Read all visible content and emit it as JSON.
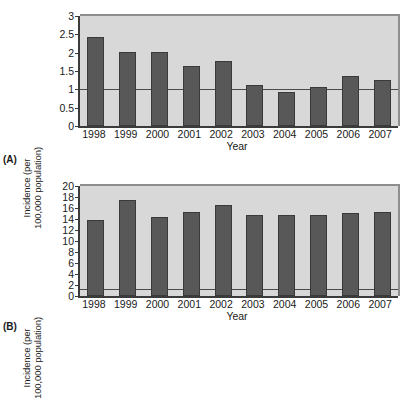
{
  "figure": {
    "panels": [
      {
        "label": "(A)",
        "chart_data": {
          "type": "bar",
          "title": "",
          "subtitle": "",
          "xlabel": "Year",
          "ylabel": "Incidence (per\n100,000 population)",
          "categories": [
            "1998",
            "1999",
            "2000",
            "2001",
            "2002",
            "2003",
            "2004",
            "2005",
            "2006",
            "2007"
          ],
          "values": [
            2.43,
            2.02,
            2.02,
            1.64,
            1.78,
            1.12,
            0.94,
            1.06,
            1.36,
            1.26
          ],
          "yticks": [
            "0",
            "0.5",
            "1",
            "1.5",
            "2",
            "2.5",
            "3"
          ],
          "ytick_values": [
            0,
            0.5,
            1,
            1.5,
            2,
            2.5,
            3
          ],
          "ylim": [
            0,
            3
          ],
          "grid": false,
          "legend": "none",
          "reference_line": 1,
          "bar_color": "#585858",
          "plot_background": "#d8d8d8",
          "axis_color": "#3b3b3b"
        }
      },
      {
        "label": "(B)",
        "chart_data": {
          "type": "bar",
          "title": "",
          "subtitle": "",
          "xlabel": "Year",
          "ylabel": "Incidence (per\n100,000 population)",
          "categories": [
            "1998",
            "1999",
            "2000",
            "2001",
            "2002",
            "2003",
            "2004",
            "2005",
            "2006",
            "2007"
          ],
          "values": [
            13.8,
            17.4,
            14.4,
            15.3,
            16.6,
            14.8,
            14.8,
            14.7,
            15.1,
            15.3
          ],
          "yticks": [
            "0",
            "2",
            "4",
            "6",
            "8",
            "10",
            "12",
            "14",
            "16",
            "18",
            "20"
          ],
          "ytick_values": [
            0,
            2,
            4,
            6,
            8,
            10,
            12,
            14,
            16,
            18,
            20
          ],
          "ylim": [
            0,
            20
          ],
          "grid": false,
          "legend": "none",
          "reference_line": 1.3,
          "bar_color": "#585858",
          "plot_background": "#d8d8d8",
          "axis_color": "#3b3b3b"
        }
      }
    ]
  }
}
